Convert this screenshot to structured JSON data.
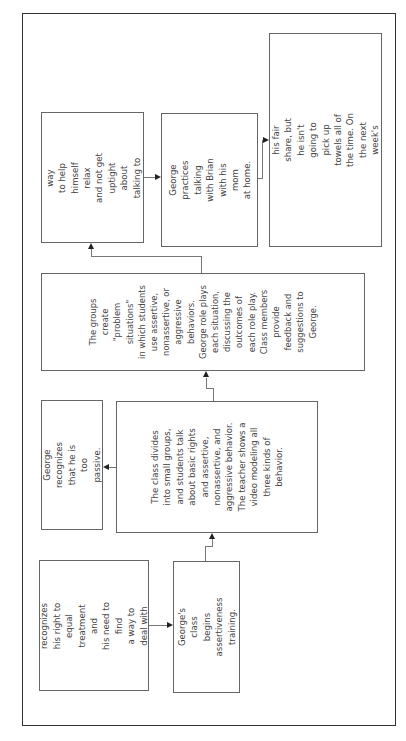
{
  "diagram": {
    "orientation": "rotated-90-counterclockwise",
    "nodes": [
      {
        "id": "recognizes-rights",
        "text": "George recognizes\nhis right to\nequal treatment and\nhis need to find\na way to deal with\nhis problem."
      },
      {
        "id": "class-begins",
        "text": "George's class\nbegins assertiveness\ntraining."
      },
      {
        "id": "class-divides",
        "text": "The class divides\ninto small groups,\nand students talk\nabout basic rights\nand assertive,\nnonassertive, and\naggressive behavior.\nThe teacher shows a\nvideo modeling all\nthree kinds of\nbehavior."
      },
      {
        "id": "too-passive",
        "text": "George recognizes\nthat he is too passive."
      },
      {
        "id": "groups-create",
        "text": "The groups\ncreate\n\"problem\nsituations\"\nin which students\nuse assertive,\nnonassertive, or\naggressive\nbehaviors.\nGeorge role plays\neach situation,\ndiscussing the\noutcomes of\neach role play.\nClass members\nprovide\nfeedback and\nsuggestions to\nGeorge."
      },
      {
        "id": "learns-relax",
        "text": "George learns a way\nto help himself relax\nand not get uptight\nabout talking to\nsomeone else."
      },
      {
        "id": "practices",
        "text": "George practices\ntalking with Brian\nwith his mom\nat home."
      },
      {
        "id": "talks-brian",
        "text": "George talks to Brian and tells him\nthat he is willing to do his fair\nshare, but he isn't going to pick up\ntowels all of the time. On the next\nweek's schedule, George's name is\nnowhere to be found!"
      }
    ],
    "edges": [
      {
        "from": "recognizes-rights",
        "to": "class-begins"
      },
      {
        "from": "class-begins",
        "to": "class-divides"
      },
      {
        "from": "class-divides",
        "to": "too-passive"
      },
      {
        "from": "class-divides",
        "to": "groups-create"
      },
      {
        "from": "groups-create",
        "to": "learns-relax"
      },
      {
        "from": "learns-relax",
        "to": "practices"
      },
      {
        "from": "practices",
        "to": "talks-brian"
      }
    ]
  }
}
